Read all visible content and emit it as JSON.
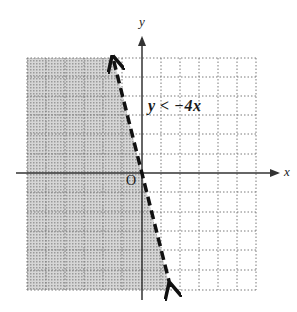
{
  "graph": {
    "x_axis_label": "x",
    "y_axis_label": "y",
    "origin_label": "O",
    "inequality_label": "y < −4x",
    "grid": {
      "xmin": -6,
      "xmax": 6,
      "ymin": -6,
      "ymax": 6,
      "step": 1,
      "style": "dotted"
    },
    "boundary": {
      "equation": "y = -4x",
      "style": "dashed",
      "endpoints": [
        [
          -1.5,
          6
        ],
        [
          1.5,
          -6
        ]
      ],
      "arrows": "both"
    },
    "shaded_region": "left of boundary (y < -4x)",
    "colors": {
      "shade": "#c8c8c8",
      "grid": "#7a7a7a",
      "axis": "#333333",
      "boundary": "#111111"
    }
  }
}
